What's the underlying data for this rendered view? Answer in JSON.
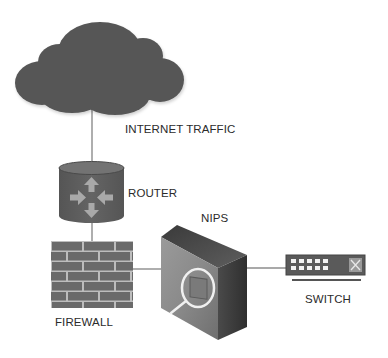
{
  "diagram": {
    "type": "network-topology",
    "nodes": [
      {
        "id": "internet",
        "label": "INTERNET TRAFFIC",
        "icon": "cloud-icon"
      },
      {
        "id": "router",
        "label": "ROUTER",
        "icon": "router-icon"
      },
      {
        "id": "firewall",
        "label": "FIREWALL",
        "icon": "firewall-brick-icon"
      },
      {
        "id": "nips",
        "label": "NIPS",
        "icon": "nips-appliance-magnifier-icon"
      },
      {
        "id": "switch",
        "label": "SWITCH",
        "icon": "switch-icon"
      }
    ],
    "edges": [
      {
        "from": "internet",
        "to": "router"
      },
      {
        "from": "router",
        "to": "firewall"
      },
      {
        "from": "firewall",
        "to": "nips"
      },
      {
        "from": "nips",
        "to": "switch"
      }
    ],
    "labels": {
      "internet": "INTERNET TRAFFIC",
      "router": "ROUTER",
      "firewall": "FIREWALL",
      "nips": "NIPS",
      "switch": "SWITCH"
    },
    "colors": {
      "cloud": "#575757",
      "router_body": "#5f5f5f",
      "router_top": "#6e6e6e",
      "router_arrows": "#a9a9a9",
      "firewall_brick": "#6a6a6a",
      "firewall_mortar": "#bdbdbd",
      "nips_front": "#8a8a8a",
      "nips_side": "#3f3f3f",
      "nips_top": "#555555",
      "switch_body": "#5a5a5a",
      "connector": "#8c8c8c",
      "text": "#2b2b2b"
    }
  }
}
